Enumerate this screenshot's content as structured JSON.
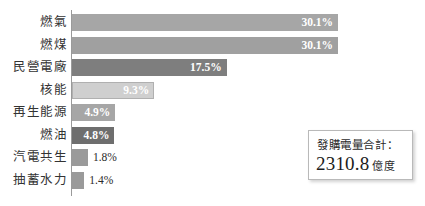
{
  "chart_data": {
    "type": "bar",
    "orientation": "horizontal",
    "title": "",
    "xlabel": "",
    "ylabel": "",
    "xlim": [
      0,
      30.1
    ],
    "grid": false,
    "legend": null,
    "categories": [
      "燃氣",
      "燃煤",
      "民營電廠",
      "核能",
      "再生能源",
      "燃油",
      "汽電共生",
      "抽蓄水力"
    ],
    "values": [
      30.1,
      30.1,
      17.5,
      9.3,
      4.9,
      4.8,
      1.8,
      1.4
    ],
    "value_labels": [
      "30.1%",
      "30.1%",
      "17.5%",
      "9.3%",
      "4.9%",
      "4.8%",
      "1.8%",
      "1.4%"
    ],
    "bars": [
      {
        "label": "燃氣",
        "value": 30.1,
        "value_label": "30.1%",
        "color": "#a6a6a6",
        "border": "none",
        "label_position": "inside",
        "label_color": "#ffffff"
      },
      {
        "label": "燃煤",
        "value": 30.1,
        "value_label": "30.1%",
        "color": "#a0a0a0",
        "border": "none",
        "label_position": "inside",
        "label_color": "#ffffff"
      },
      {
        "label": "民營電廠",
        "value": 17.5,
        "value_label": "17.5%",
        "color": "#7e7e7e",
        "border": "none",
        "label_position": "inside",
        "label_color": "#ffffff"
      },
      {
        "label": "核能",
        "value": 9.3,
        "value_label": "9.3%",
        "color": "#cfcfcf",
        "border": "#b0b0b0",
        "label_position": "inside",
        "label_color": "#ffffff"
      },
      {
        "label": "再生能源",
        "value": 4.9,
        "value_label": "4.9%",
        "color": "#a6a6a6",
        "border": "none",
        "label_position": "inside",
        "label_color": "#ffffff"
      },
      {
        "label": "燃油",
        "value": 4.8,
        "value_label": "4.8%",
        "color": "#6e6e6e",
        "border": "none",
        "label_position": "inside",
        "label_color": "#ffffff"
      },
      {
        "label": "汽電共生",
        "value": 1.8,
        "value_label": "1.8%",
        "color": "#9a9a9a",
        "border": "none",
        "label_position": "outside",
        "label_color": "#2b2b2b"
      },
      {
        "label": "抽蓄水力",
        "value": 1.4,
        "value_label": "1.4%",
        "color": "#9a9a9a",
        "border": "none",
        "label_position": "outside",
        "label_color": "#2b2b2b"
      }
    ],
    "annotations": [
      {
        "name": "total-callout",
        "title": "發購電量合計：",
        "value": "2310.8",
        "unit": "億度"
      }
    ]
  },
  "callout": {
    "title": "發購電量合計：",
    "value": "2310.8",
    "unit": "億度"
  },
  "colors": {
    "background": "#ffffff",
    "axis": "#9a9a9a",
    "label_text": "#333333",
    "value_text_inside": "#ffffff",
    "value_text_outside": "#2b2b2b",
    "callout_border": "#b9b9b9"
  }
}
